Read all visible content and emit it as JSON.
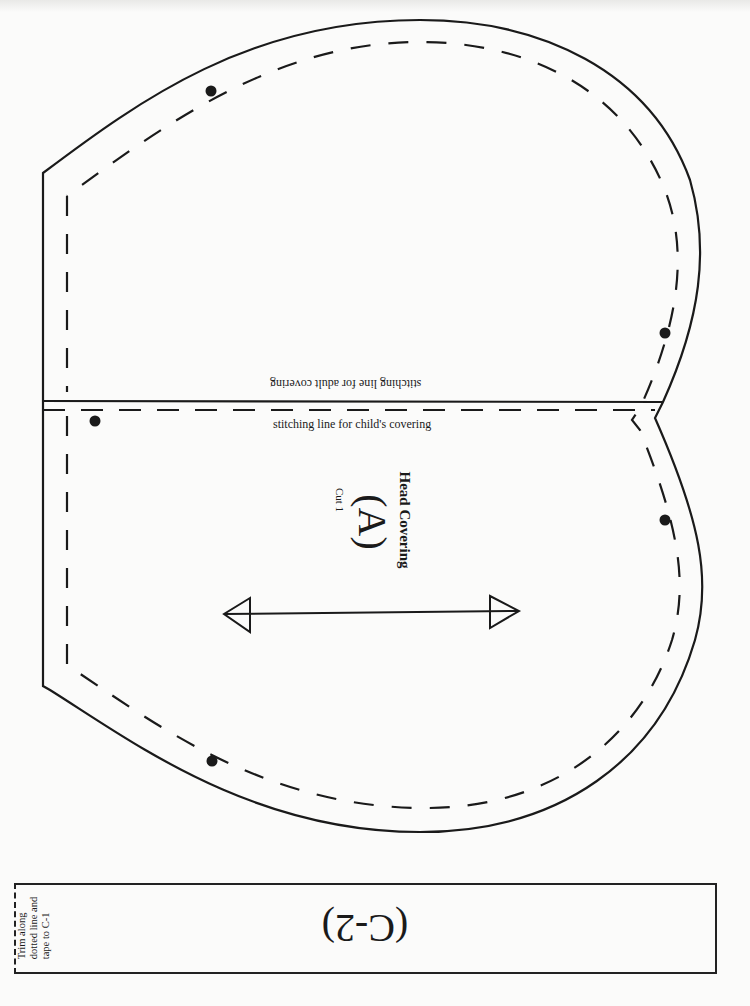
{
  "pattern": {
    "piece_name": "Head Covering",
    "piece_letter": "(A)",
    "cut_instruction": "Cut 1",
    "stitching_lines": {
      "adult": "stitching line for adult covering",
      "child": "stitching line for child's covering"
    },
    "markings": {
      "grainline": "double-headed-arrow",
      "match_dots": 5
    }
  },
  "tape_strip": {
    "page_id": "(C-2)",
    "instruction_lines": [
      "Trim along",
      "dotted line and",
      "tape to C-1"
    ]
  },
  "colors": {
    "paper": "#fbfbfa",
    "ink": "#1a1a1a"
  }
}
